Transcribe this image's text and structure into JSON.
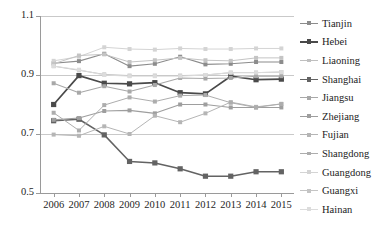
{
  "chart_data": {
    "type": "line",
    "title": "",
    "xlabel": "",
    "ylabel": "",
    "x": [
      2006,
      2007,
      2008,
      2009,
      2010,
      2011,
      2012,
      2013,
      2014,
      2015
    ],
    "xtick_labels": [
      "2006",
      "2007",
      "2008",
      "2009",
      "2010",
      "2011",
      "2012",
      "2013",
      "2014",
      "2015"
    ],
    "ytick_labels": [
      "1.1",
      "0.9",
      "0.7",
      "0.5"
    ],
    "yticks": [
      1.1,
      0.9,
      0.7,
      0.5
    ],
    "ylim": [
      0.5,
      1.1
    ],
    "grid": "horizontal",
    "legend_position": "right",
    "series": [
      {
        "name": "Tianjin",
        "color": "#8c8c8c",
        "width": 1.1,
        "marker": 2.0,
        "values": [
          0.94,
          0.947,
          0.972,
          0.93,
          0.938,
          0.962,
          0.936,
          0.938,
          0.944,
          0.944
        ]
      },
      {
        "name": "Hebei",
        "color": "#4a4a4a",
        "width": 1.7,
        "marker": 2.6,
        "values": [
          0.8,
          0.898,
          0.872,
          0.87,
          0.874,
          0.84,
          0.836,
          0.896,
          0.884,
          0.886
        ]
      },
      {
        "name": "Liaoning",
        "color": "#bfbfbf",
        "width": 1.0,
        "marker": 2.0,
        "values": [
          0.93,
          0.916,
          0.902,
          0.898,
          0.898,
          0.898,
          0.9,
          0.908,
          0.908,
          0.91
        ]
      },
      {
        "name": "Shanghai",
        "color": "#636363",
        "width": 1.5,
        "marker": 2.6,
        "values": [
          0.745,
          0.75,
          0.697,
          0.607,
          0.602,
          0.582,
          0.557,
          0.557,
          0.572,
          0.572
        ]
      },
      {
        "name": "Jiangsu",
        "color": "#a8a8a8",
        "width": 1.1,
        "marker": 2.0,
        "values": [
          0.872,
          0.84,
          0.862,
          0.844,
          0.866,
          0.89,
          0.888,
          0.89,
          0.896,
          0.896
        ]
      },
      {
        "name": "Zhejiang",
        "color": "#9e9e9e",
        "width": 1.1,
        "marker": 2.0,
        "values": [
          0.748,
          0.754,
          0.778,
          0.78,
          0.77,
          0.8,
          0.8,
          0.79,
          0.79,
          0.79
        ]
      },
      {
        "name": "Fujian",
        "color": "#b5b5b5",
        "width": 1.0,
        "marker": 2.0,
        "values": [
          0.698,
          0.694,
          0.726,
          0.7,
          0.762,
          0.74,
          0.77,
          0.808,
          0.792,
          0.802
        ]
      },
      {
        "name": "Shangdong",
        "color": "#adadad",
        "width": 1.0,
        "marker": 2.0,
        "values": [
          0.772,
          0.712,
          0.798,
          0.824,
          0.81,
          0.83,
          0.832,
          0.806,
          0.79,
          0.802
        ]
      },
      {
        "name": "Guangdong",
        "color": "#d4d4d4",
        "width": 1.0,
        "marker": 2.0,
        "values": [
          0.948,
          0.962,
          0.994,
          0.988,
          0.986,
          0.99,
          0.988,
          0.988,
          0.99,
          0.99
        ]
      },
      {
        "name": "Guangxi",
        "color": "#c4c4c4",
        "width": 1.0,
        "marker": 2.0,
        "values": [
          0.938,
          0.966,
          0.97,
          0.944,
          0.95,
          0.958,
          0.95,
          0.948,
          0.958,
          0.958
        ]
      },
      {
        "name": "Hainan",
        "color": "#dcdcdc",
        "width": 1.0,
        "marker": 2.0,
        "values": [
          0.93,
          0.918,
          0.9,
          0.896,
          0.896,
          0.896,
          0.9,
          0.908,
          0.908,
          0.91
        ]
      }
    ]
  },
  "axis": {
    "line_color": "#9a9a9a",
    "grid_color": "#c9c9c9"
  }
}
